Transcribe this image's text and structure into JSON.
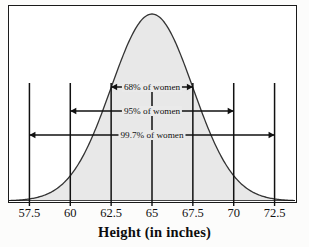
{
  "figure": {
    "axis_title": "Height (in inches)",
    "background_color": "#ffffff",
    "frame_color": "#1a1a1a"
  },
  "chart_data": {
    "type": "area",
    "title": "",
    "subtitle": "",
    "xlabel": "Height (in inches)",
    "ylabel": "",
    "distribution": "normal",
    "mean": 65,
    "std_dev": 2.5,
    "xlim": [
      56.25,
      73.75
    ],
    "ylim": [
      0,
      1.08
    ],
    "grid": false,
    "legend_position": "none",
    "xticks": [
      57.5,
      60,
      62.5,
      65,
      67.5,
      70,
      72.5
    ],
    "xtick_labels": [
      "57.5",
      "60",
      "62.5",
      "65",
      "67.5",
      "70",
      "72.5"
    ],
    "curve_points_x": [
      56.25,
      57.5,
      58.75,
      60,
      61.25,
      62.5,
      63.75,
      65,
      66.25,
      67.5,
      68.75,
      70,
      71.25,
      72.5,
      73.75
    ],
    "curve_points_y": [
      0.0063,
      0.0228,
      0.0668,
      0.1587,
      0.3085,
      0.5,
      0.6915,
      1.0,
      0.6915,
      0.5,
      0.3085,
      0.1587,
      0.0668,
      0.0228,
      0.0063
    ],
    "fill_color_center": "#e8e8e8",
    "fill_color_tails": "#a8a8a8",
    "curve_line_color": "#333333",
    "vertical_line_color": "#111111",
    "shaded_tail_ranges": [
      [
        56.25,
        60
      ],
      [
        70,
        73.75
      ]
    ],
    "annotations": [
      {
        "label": "68% of women",
        "from": 62.5,
        "to": 67.5,
        "sigma": 1,
        "percent": 68.0
      },
      {
        "label": "95% of women",
        "from": 60.0,
        "to": 70.0,
        "sigma": 2,
        "percent": 95.0
      },
      {
        "label": "99.7% of women",
        "from": 57.5,
        "to": 72.5,
        "sigma": 3,
        "percent": 99.7
      }
    ]
  }
}
